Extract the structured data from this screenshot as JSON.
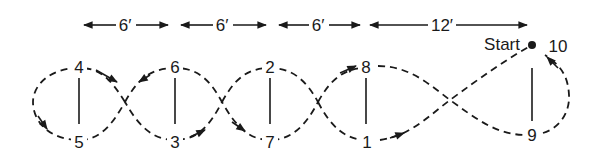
{
  "dimensions": [
    {
      "label": "6′",
      "x1": 82,
      "x2": 170,
      "lx": 125
    },
    {
      "label": "6′",
      "x1": 179,
      "x2": 268,
      "lx": 222
    },
    {
      "label": "6′",
      "x1": 277,
      "x2": 362,
      "lx": 318
    },
    {
      "label": "12′",
      "x1": 368,
      "x2": 528,
      "lx": 440
    }
  ],
  "start_label": "Start",
  "points": [
    {
      "id": "4",
      "label": "4",
      "x": 79,
      "y": 67
    },
    {
      "id": "5",
      "label": "5",
      "x": 79,
      "y": 142
    },
    {
      "id": "6",
      "label": "6",
      "x": 175,
      "y": 67
    },
    {
      "id": "3",
      "label": "3",
      "x": 175,
      "y": 142
    },
    {
      "id": "2",
      "label": "2",
      "x": 270,
      "y": 67
    },
    {
      "id": "7",
      "label": "7",
      "x": 270,
      "y": 142
    },
    {
      "id": "8",
      "label": "8",
      "x": 366,
      "y": 67
    },
    {
      "id": "1",
      "label": "1",
      "x": 367,
      "y": 142
    },
    {
      "id": "9",
      "label": "9",
      "x": 532,
      "y": 135
    },
    {
      "id": "10",
      "label": "10",
      "x": 558,
      "y": 46
    }
  ],
  "colors": {
    "ink": "#1a1a1a",
    "background": "#ffffff"
  }
}
